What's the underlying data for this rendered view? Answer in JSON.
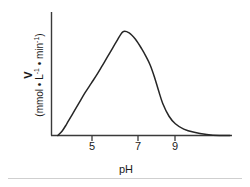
{
  "chart_data": {
    "type": "line",
    "title": "",
    "xlabel": "pH",
    "ylabel_symbol": "V",
    "ylabel_units": "(mmol • L−1 • min−1)",
    "ylabel_units_parts": {
      "open": "(mmol • L",
      "exp1": "-1",
      "mid": " • min",
      "exp2": "-1",
      "close": ")"
    },
    "xticks": [
      5,
      7,
      9
    ],
    "xtick_labels": [
      "5",
      "7",
      "9"
    ],
    "yticks": [],
    "ytick_labels": [],
    "xlim": [
      3.6,
      12.2
    ],
    "ylim": [
      0,
      1.08
    ],
    "grid": false,
    "legend": null,
    "line_color": "#262626",
    "axis_color": "#3a3a3a",
    "background": "#ffffff",
    "series": [
      {
        "name": "reaction velocity vs pH",
        "x": [
          3.9,
          4.1,
          4.3,
          4.6,
          4.9,
          5.2,
          5.5,
          5.8,
          6.1,
          6.4,
          6.7,
          7.0,
          7.3,
          7.6,
          7.9,
          8.1,
          8.3,
          8.5,
          8.7,
          8.9,
          9.2,
          9.5,
          9.9,
          10.4,
          11.0,
          11.6,
          12.1
        ],
        "y": [
          0.0,
          0.04,
          0.1,
          0.2,
          0.3,
          0.4,
          0.49,
          0.58,
          0.68,
          0.78,
          0.88,
          0.97,
          0.96,
          0.9,
          0.81,
          0.74,
          0.66,
          0.55,
          0.42,
          0.3,
          0.18,
          0.11,
          0.06,
          0.03,
          0.01,
          0.0,
          0.0
        ]
      }
    ]
  },
  "axes": {
    "xaxis_name": "ph-axis",
    "yaxis_name": "velocity-axis"
  }
}
